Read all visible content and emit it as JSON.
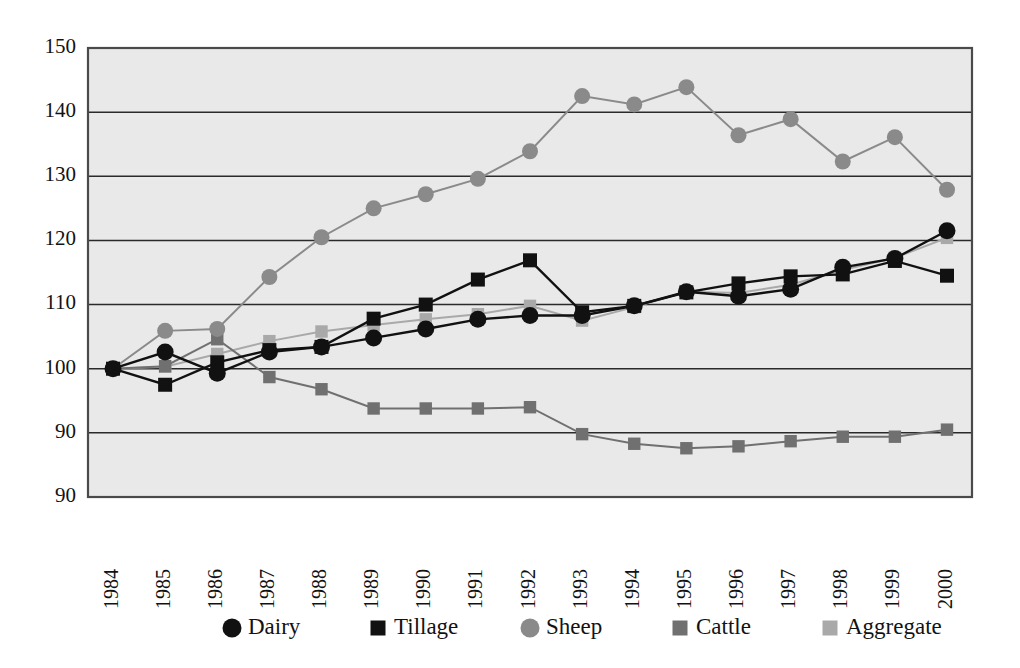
{
  "chart_data": {
    "type": "line",
    "title": "",
    "subtitle": "",
    "xlabel": "",
    "ylabel": "",
    "x": [
      1984,
      1985,
      1986,
      1987,
      1988,
      1989,
      1990,
      1991,
      1992,
      1993,
      1994,
      1995,
      1996,
      1997,
      1998,
      1999,
      2000
    ],
    "categories": [
      "1984",
      "1985",
      "1986",
      "1987",
      "1988",
      "1989",
      "1990",
      "1991",
      "1992",
      "1993",
      "1994",
      "1995",
      "1996",
      "1997",
      "1998",
      "1999",
      "2000"
    ],
    "ylim": [
      80,
      150
    ],
    "xlim": [
      1984,
      2000
    ],
    "y_ticks": [
      150,
      140,
      130,
      120,
      110,
      100,
      90
    ],
    "y_tick_labels": [
      "150",
      "140",
      "130",
      "120",
      "110",
      "100",
      "90",
      "90"
    ],
    "y_axis_base_label": "90",
    "grid": true,
    "grid_axis": "y",
    "legend_position": "bottom",
    "plot_background": "#e9e9e9",
    "series": [
      {
        "name": "Dairy",
        "marker": "circle",
        "color": "#111111",
        "line_color": "#111111",
        "values": [
          100.0,
          102.6,
          99.3,
          102.6,
          103.4,
          104.8,
          106.2,
          107.7,
          108.3,
          108.3,
          109.8,
          112.0,
          111.3,
          112.4,
          115.8,
          117.2,
          121.5
        ]
      },
      {
        "name": "Tillage",
        "marker": "square",
        "color": "#111111",
        "line_color": "#111111",
        "values": [
          100.0,
          97.5,
          101.0,
          102.9,
          103.4,
          107.8,
          110.0,
          113.9,
          116.9,
          108.8,
          109.8,
          111.9,
          113.3,
          114.4,
          114.7,
          116.8,
          114.5
        ]
      },
      {
        "name": "Sheep",
        "marker": "circle",
        "color": "#8a8a8a",
        "line_color": "#8a8a8a",
        "values": [
          100.0,
          105.9,
          106.2,
          114.3,
          120.5,
          125.0,
          127.2,
          129.6,
          133.9,
          142.5,
          141.2,
          143.9,
          136.4,
          138.9,
          132.3,
          136.1,
          127.9
        ]
      },
      {
        "name": "Cattle",
        "marker": "square",
        "color": "#707070",
        "line_color": "#707070",
        "values": [
          100.0,
          100.4,
          104.6,
          98.7,
          96.8,
          93.8,
          93.8,
          93.8,
          94.0,
          89.8,
          88.3,
          87.6,
          87.9,
          88.7,
          89.4,
          89.4,
          90.5
        ]
      },
      {
        "name": "Aggregate",
        "marker": "square",
        "color": "#a9a9a9",
        "line_color": "#a9a9a9",
        "values": [
          100.0,
          100.3,
          102.3,
          104.3,
          105.8,
          106.8,
          107.7,
          108.5,
          109.8,
          107.5,
          109.6,
          112.0,
          111.8,
          113.1,
          115.4,
          117.3,
          120.4
        ]
      }
    ],
    "legend": [
      {
        "label": "Dairy",
        "marker": "circle",
        "color": "#111111"
      },
      {
        "label": "Tillage",
        "marker": "square",
        "color": "#111111"
      },
      {
        "label": "Sheep",
        "marker": "circle",
        "color": "#8a8a8a"
      },
      {
        "label": "Cattle",
        "marker": "square",
        "color": "#707070"
      },
      {
        "label": "Aggregate",
        "marker": "square",
        "color": "#a9a9a9"
      }
    ]
  }
}
